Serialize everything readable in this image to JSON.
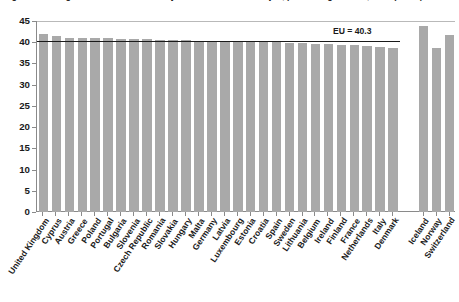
{
  "chart_data": {
    "type": "bar",
    "title": "Figure 3: Average number of usual weekly hours of work in main job, persons aged 20-64, 2013 (hours)",
    "xlabel": "",
    "ylabel": "",
    "ylim": [
      0,
      45
    ],
    "ytick_step": 5,
    "ytick_labels": [
      "0",
      "5",
      "10",
      "15",
      "20",
      "25",
      "30",
      "35",
      "40",
      "45"
    ],
    "ytick_values": [
      0,
      5,
      10,
      15,
      20,
      25,
      30,
      35,
      40,
      45
    ],
    "grid": false,
    "legend": "none",
    "bar_color": "#a9a9a9",
    "axis_color": "#8a8a8a",
    "reference_line": {
      "label": "EU = 40.3",
      "value": 40.3,
      "color": "#1a1a1a"
    },
    "groups": [
      {
        "name": "eu-member-states",
        "gap_after": true
      },
      {
        "name": "non-eu-countries",
        "gap_after": false
      }
    ],
    "categories": [
      "United Kingdom",
      "Cyprus",
      "Austria",
      "Greece",
      "Poland",
      "Portugal",
      "Bulgaria",
      "Slovenia",
      "Czech Republic",
      "Romania",
      "Slovakia",
      "Hungary",
      "Malta",
      "Germany",
      "Latvia",
      "Luxembourg",
      "Estonia",
      "Croatia",
      "Spain",
      "Sweden",
      "Lithuania",
      "Belgium",
      "Ireland",
      "Finland",
      "France",
      "Netherlands",
      "Italy",
      "Denmark",
      "Iceland",
      "Norway",
      "Switzerland"
    ],
    "values": [
      42.0,
      41.4,
      41.1,
      41.0,
      41.0,
      40.9,
      40.8,
      40.8,
      40.7,
      40.6,
      40.6,
      40.5,
      40.4,
      40.3,
      40.3,
      40.2,
      40.1,
      40.1,
      40.0,
      39.9,
      39.8,
      39.7,
      39.5,
      39.4,
      39.3,
      39.0,
      38.8,
      38.6,
      43.9,
      38.6,
      41.6
    ],
    "group_of_category": [
      "eu",
      "eu",
      "eu",
      "eu",
      "eu",
      "eu",
      "eu",
      "eu",
      "eu",
      "eu",
      "eu",
      "eu",
      "eu",
      "eu",
      "eu",
      "eu",
      "eu",
      "eu",
      "eu",
      "eu",
      "eu",
      "eu",
      "eu",
      "eu",
      "eu",
      "eu",
      "eu",
      "eu",
      "non-eu",
      "non-eu",
      "non-eu"
    ]
  }
}
